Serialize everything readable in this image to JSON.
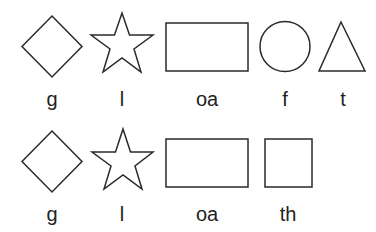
{
  "rows": [
    {
      "items": [
        {
          "shape": "diamond",
          "label": "g"
        },
        {
          "shape": "star",
          "label": "l"
        },
        {
          "shape": "rectangle",
          "label": "oa"
        },
        {
          "shape": "circle",
          "label": "f"
        },
        {
          "shape": "triangle",
          "label": "t"
        }
      ]
    },
    {
      "items": [
        {
          "shape": "diamond",
          "label": "g"
        },
        {
          "shape": "star",
          "label": "l"
        },
        {
          "shape": "rectangle",
          "label": "oa"
        },
        {
          "shape": "square",
          "label": "th"
        }
      ]
    }
  ],
  "colors": {
    "stroke": "#2a2a2a",
    "fill": "#ffffff",
    "text": "#222222",
    "background": "#ffffff"
  }
}
